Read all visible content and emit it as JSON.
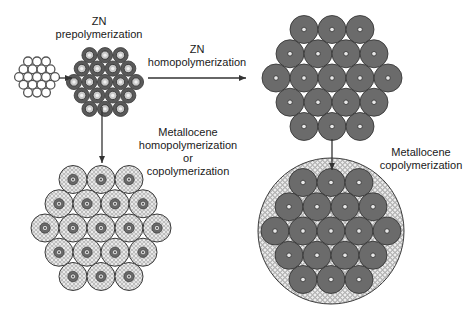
{
  "labels": {
    "zn_prepoly": {
      "line1": "ZN",
      "line2": "prepolymerization"
    },
    "zn_homopoly": {
      "line1": "ZN",
      "line2": "homopolymerization"
    },
    "metallocene_left": {
      "line1": "Metallocene",
      "line2": "homopolymerization",
      "line3": "or",
      "line4": "copolymerization"
    },
    "metallocene_right": {
      "line1": "Metallocene",
      "line2": "copolymerization"
    }
  },
  "colors": {
    "particle_dark": "#6b6b6b",
    "particle_outline": "#2e2e2e",
    "arrow": "#333333",
    "text": "#1a1a1a",
    "copolymer_pattern": "#9a9a9a",
    "background": "#ffffff"
  },
  "clusters": {
    "catalyst": {
      "cx": 37,
      "cy": 77,
      "spacing": 9,
      "r": 4.4,
      "style": "hollow"
    },
    "prepolymer": {
      "cx": 105,
      "cy": 82,
      "spacing": 15.5,
      "r": 7.6,
      "style": "prepoly"
    },
    "homopolymer": {
      "cx": 332,
      "cy": 78,
      "spacing": 28,
      "r": 14,
      "style": "solid"
    },
    "metallocene_hom": {
      "cx": 101,
      "cy": 228,
      "spacing": 28,
      "r": 14,
      "style": "hatched"
    },
    "heterophasic": {
      "cx": 331,
      "cy": 231,
      "spacing": 28,
      "r": 14,
      "style": "solid",
      "outer_r": 73
    }
  },
  "arrows": [
    {
      "name": "catalyst-to-prepoly-arrow",
      "x1": 59,
      "y1": 78,
      "x2": 72,
      "y2": 78
    },
    {
      "name": "zn-homopoly-arrow",
      "x1": 148,
      "y1": 78,
      "x2": 246,
      "y2": 78
    },
    {
      "name": "metallocene-hom-arrow",
      "x1": 102,
      "y1": 107,
      "x2": 102,
      "y2": 163
    },
    {
      "name": "metallocene-cop-arrow",
      "x1": 332,
      "y1": 139,
      "x2": 332,
      "y2": 170
    }
  ]
}
